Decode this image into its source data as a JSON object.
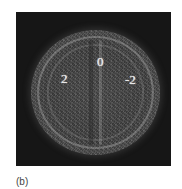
{
  "figure": {
    "caption": "(b)",
    "image": {
      "description": "Speckled circular interference pattern on dark background",
      "background_color": "#161616",
      "labels": [
        {
          "text": "0",
          "position": "top-center"
        },
        {
          "text": "2",
          "position": "left"
        },
        {
          "text": "-2",
          "position": "right"
        }
      ]
    }
  }
}
